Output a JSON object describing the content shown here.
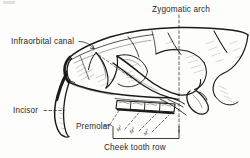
{
  "figure": {
    "background_color": "#fdfdfc",
    "ink_color": "#1a1a1a",
    "labels": {
      "infraorbital_canal": "Infraorbital canal",
      "zygomatic_arch": "Zygomatic arch",
      "incisor": "Incisor",
      "premolar": "Premolar",
      "cheek_tooth_row": "Cheek tooth row"
    },
    "tooth_labels": [
      {
        "base": "M",
        "superscript": "1"
      },
      {
        "base": "M",
        "superscript": "2"
      },
      {
        "base": "M",
        "superscript": "3"
      }
    ],
    "leader_lines": {
      "infraorbital_canal": "solid-hook",
      "zygomatic_arch": "vertical-dashed",
      "incisor": "dashed",
      "premolar": "dashed-fan",
      "cheek_tooth_row": "bracket"
    },
    "tooth_count_in_row": 4
  }
}
